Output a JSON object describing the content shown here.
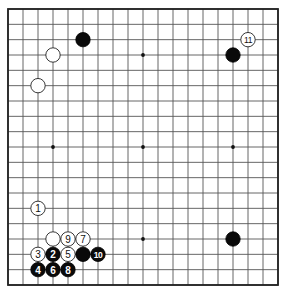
{
  "diagram": {
    "type": "go-board",
    "board_size": 19,
    "star_points": [
      [
        4,
        4
      ],
      [
        10,
        4
      ],
      [
        16,
        4
      ],
      [
        4,
        10
      ],
      [
        10,
        10
      ],
      [
        16,
        10
      ],
      [
        4,
        16
      ],
      [
        10,
        16
      ],
      [
        16,
        16
      ]
    ],
    "stones": [
      {
        "color": "black",
        "col": 6,
        "row": 3,
        "label": ""
      },
      {
        "color": "white",
        "col": 4,
        "row": 4,
        "label": ""
      },
      {
        "color": "white",
        "col": 3,
        "row": 6,
        "label": ""
      },
      {
        "color": "black",
        "col": 16,
        "row": 4,
        "label": ""
      },
      {
        "color": "white",
        "col": 17,
        "row": 3,
        "label": "11"
      },
      {
        "color": "black",
        "col": 16,
        "row": 16,
        "label": ""
      },
      {
        "color": "white",
        "col": 3,
        "row": 14,
        "label": "1"
      },
      {
        "color": "white",
        "col": 4,
        "row": 16,
        "label": ""
      },
      {
        "color": "white",
        "col": 5,
        "row": 16,
        "label": "9"
      },
      {
        "color": "white",
        "col": 6,
        "row": 16,
        "label": "7"
      },
      {
        "color": "white",
        "col": 3,
        "row": 17,
        "label": "3"
      },
      {
        "color": "black",
        "col": 4,
        "row": 17,
        "label": "2"
      },
      {
        "color": "white",
        "col": 5,
        "row": 17,
        "label": "5"
      },
      {
        "color": "black",
        "col": 6,
        "row": 17,
        "label": ""
      },
      {
        "color": "black",
        "col": 7,
        "row": 17,
        "label": "10"
      },
      {
        "color": "black",
        "col": 3,
        "row": 18,
        "label": "4"
      },
      {
        "color": "black",
        "col": 4,
        "row": 18,
        "label": "6"
      },
      {
        "color": "black",
        "col": 5,
        "row": 18,
        "label": "8"
      }
    ],
    "colors": {
      "board": "#ffffff",
      "line": "#555555",
      "black_stone": "#0a0a0a",
      "white_stone": "#ffffff"
    }
  }
}
